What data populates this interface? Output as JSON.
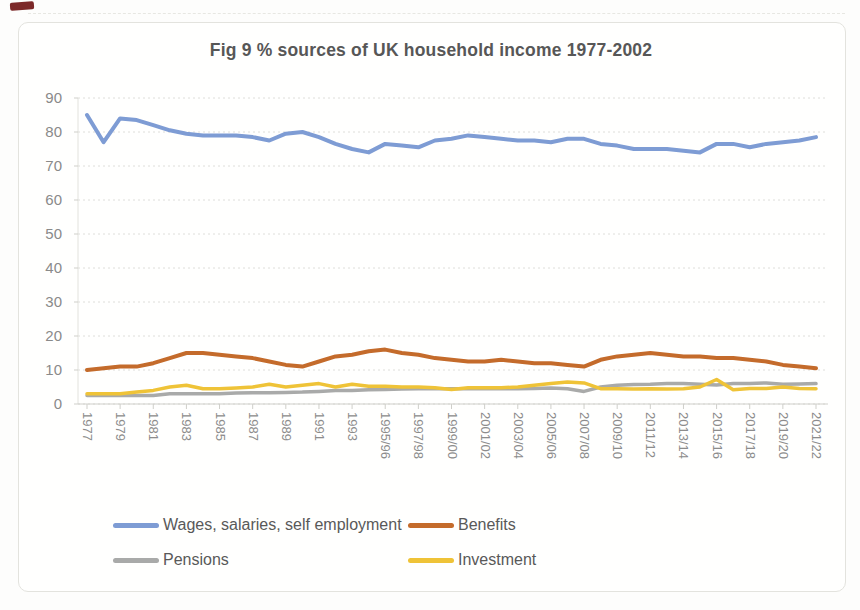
{
  "title": "Fig 9 % sources of UK household income 1977-2002",
  "chart_data": {
    "type": "line",
    "title": "Fig 9 % sources of UK household income 1977-2002",
    "xlabel": "",
    "ylabel": "",
    "ylim": [
      0,
      90
    ],
    "y_ticks": [
      0,
      10,
      20,
      30,
      40,
      50,
      60,
      70,
      80,
      90
    ],
    "grid": "horizontal-dashed",
    "legend_position": "bottom",
    "categories": [
      "1977",
      "1978",
      "1979",
      "1980",
      "1981",
      "1982",
      "1983",
      "1984",
      "1985",
      "1986",
      "1987",
      "1988",
      "1989",
      "1990",
      "1991",
      "1992",
      "1993",
      "1994/95",
      "1995/96",
      "1996/97",
      "1997/98",
      "1998/99",
      "1999/00",
      "2000/01",
      "2001/02",
      "2002/03",
      "2003/04",
      "2004/05",
      "2005/06",
      "2006/07",
      "2007/08",
      "2008/09",
      "2009/10",
      "2010/11",
      "2011/12",
      "2012/13",
      "2013/14",
      "2014/15",
      "2015/16",
      "2016/17",
      "2017/18",
      "2018/19",
      "2019/20",
      "2020/21",
      "2021/22"
    ],
    "x_tick_step": 2,
    "x_tick_labels": [
      "1977",
      "1979",
      "1981",
      "1983",
      "1985",
      "1987",
      "1989",
      "1991",
      "1993",
      "1995/96",
      "1997/98",
      "1999/00",
      "2001/02",
      "2003/04",
      "2005/06",
      "2007/08",
      "2009/10",
      "2011/12",
      "2013/14",
      "2015/16",
      "2017/18",
      "2019/20",
      "2021/22"
    ],
    "series": [
      {
        "name": "Wages, salaries, self employment",
        "color": "#7e9cd4",
        "values": [
          85,
          77,
          84,
          83.5,
          82,
          80.5,
          79.5,
          79,
          79,
          79,
          78.5,
          77.5,
          79.5,
          80,
          78.5,
          76.5,
          75,
          74,
          76.5,
          76,
          75.5,
          77.5,
          78,
          79,
          78.5,
          78,
          77.5,
          77.5,
          77,
          78,
          78,
          76.5,
          76,
          75,
          75,
          75,
          74.5,
          74,
          76.5,
          76.5,
          75.5,
          76.5,
          77,
          77.5,
          78.5
        ]
      },
      {
        "name": "Benefits",
        "color": "#c46b2b",
        "values": [
          10,
          10.5,
          11,
          11,
          12,
          13.5,
          15,
          15,
          14.5,
          14,
          13.5,
          12.5,
          11.5,
          11,
          12.5,
          14,
          14.5,
          15.5,
          16,
          15,
          14.5,
          13.5,
          13,
          12.5,
          12.5,
          13,
          12.5,
          12,
          12,
          11.5,
          11,
          13,
          14,
          14.5,
          15,
          14.5,
          14,
          14,
          13.5,
          13.5,
          13,
          12.5,
          11.5,
          11,
          10.5
        ]
      },
      {
        "name": "Pensions",
        "color": "#a9aaa9",
        "values": [
          2.5,
          2.5,
          2.5,
          2.5,
          2.5,
          3,
          3,
          3,
          3,
          3.2,
          3.3,
          3.3,
          3.4,
          3.5,
          3.7,
          4,
          4,
          4.2,
          4.3,
          4.4,
          4.5,
          4.5,
          4.5,
          4.5,
          4.5,
          4.5,
          4.5,
          4.6,
          4.7,
          4.5,
          3.7,
          5,
          5.5,
          5.7,
          5.8,
          6,
          6,
          5.8,
          5.6,
          6,
          6,
          6.2,
          5.8,
          5.9,
          6
        ]
      },
      {
        "name": "Investment",
        "color": "#efc337",
        "values": [
          3,
          3,
          3,
          3.5,
          4,
          5,
          5.5,
          4.5,
          4.5,
          4.7,
          5,
          5.8,
          5,
          5.5,
          6,
          5,
          5.8,
          5.2,
          5.2,
          5,
          5,
          4.8,
          4.3,
          4.8,
          4.8,
          4.8,
          5,
          5.5,
          6,
          6.5,
          6.2,
          4.5,
          4.5,
          4.4,
          4.5,
          4.4,
          4.5,
          5,
          7.2,
          4.2,
          4.6,
          4.6,
          5,
          4.6,
          4.5
        ]
      }
    ]
  }
}
